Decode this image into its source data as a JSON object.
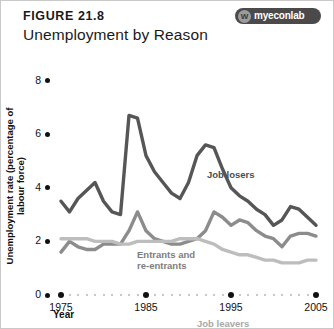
{
  "figure": {
    "number": "FIGURE 21.8",
    "title": "Unemployment by Reason",
    "badge_text": "myeconlab",
    "badge_mark": "W"
  },
  "chart_data": {
    "type": "line",
    "title": "Unemployment by Reason",
    "xlabel": "Year",
    "ylabel": "Unemployment rate (percentage of labour force)",
    "xlim": [
      1975,
      2005
    ],
    "ylim": [
      0,
      8
    ],
    "yticks": [
      0,
      2,
      4,
      6,
      8
    ],
    "xticks": [
      1975,
      1985,
      1995,
      2005
    ],
    "grid": false,
    "legend": "inline-annotations",
    "x": [
      1975,
      1976,
      1977,
      1978,
      1979,
      1980,
      1981,
      1982,
      1983,
      1984,
      1985,
      1986,
      1987,
      1988,
      1989,
      1990,
      1991,
      1992,
      1993,
      1994,
      1995,
      1996,
      1997,
      1998,
      1999,
      2000,
      2001,
      2002,
      2003,
      2004,
      2005
    ],
    "series": [
      {
        "name": "Job losers",
        "color": "#565656",
        "values": [
          3.5,
          3.1,
          3.6,
          3.9,
          4.2,
          3.5,
          3.1,
          3.0,
          6.7,
          6.6,
          5.2,
          4.6,
          4.2,
          3.8,
          3.6,
          4.2,
          5.2,
          5.6,
          5.5,
          4.7,
          4.0,
          3.7,
          3.5,
          3.2,
          3.0,
          2.6,
          2.8,
          3.3,
          3.2,
          2.9,
          2.6
        ]
      },
      {
        "name": "Entrants and re-entrants",
        "color": "#8c8c8c",
        "values": [
          1.6,
          2.0,
          1.8,
          1.7,
          1.7,
          1.9,
          1.9,
          1.9,
          2.4,
          3.1,
          2.4,
          2.1,
          2.0,
          1.9,
          1.9,
          2.0,
          2.1,
          2.4,
          3.1,
          2.9,
          2.6,
          2.8,
          2.7,
          2.4,
          2.2,
          2.1,
          1.8,
          2.2,
          2.3,
          2.3,
          2.2
        ]
      },
      {
        "name": "Job leavers",
        "color": "#bdbdbd",
        "values": [
          2.1,
          2.1,
          2.1,
          2.1,
          2.0,
          2.0,
          2.0,
          1.9,
          1.9,
          2.0,
          2.0,
          2.0,
          2.0,
          2.0,
          2.1,
          2.1,
          2.1,
          2.0,
          1.9,
          1.7,
          1.6,
          1.5,
          1.5,
          1.4,
          1.3,
          1.3,
          1.2,
          1.2,
          1.2,
          1.3,
          1.3
        ]
      }
    ]
  }
}
